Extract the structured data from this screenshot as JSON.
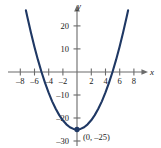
{
  "chart_data": {
    "type": "line",
    "title": "",
    "subtitle": "",
    "xlabel": "x",
    "ylabel": "y",
    "xlim": [
      -9,
      9
    ],
    "ylim": [
      -32,
      26
    ],
    "grid": false,
    "legend": null,
    "equation": "y = x^2 - 25",
    "x_ticks": [
      -8,
      -6,
      -4,
      -2,
      2,
      4,
      6,
      8
    ],
    "x_tick_labels": [
      "–8",
      "–6",
      "–4",
      "–2",
      "2",
      "4",
      "6",
      "8"
    ],
    "y_ticks": [
      20,
      10,
      -10,
      -20,
      -30
    ],
    "y_tick_labels": [
      "20",
      "10",
      "–10",
      "–20",
      "–30"
    ],
    "series": [
      {
        "name": "parabola",
        "color": "#1f3864",
        "x": [
          -7.2,
          -7.0,
          -6.5,
          -6.0,
          -5.5,
          -5.0,
          -4.5,
          -4.0,
          -3.5,
          -3.0,
          -2.5,
          -2.0,
          -1.5,
          -1.0,
          -0.5,
          0.0,
          0.5,
          1.0,
          1.5,
          2.0,
          2.5,
          3.0,
          3.5,
          4.0,
          4.5,
          5.0,
          5.5,
          6.0,
          6.5,
          7.0,
          7.2
        ],
        "y": [
          26.84,
          24.0,
          17.25,
          11.0,
          5.25,
          0.0,
          -4.75,
          -9.0,
          -12.75,
          -16.0,
          -18.75,
          -21.0,
          -22.75,
          -24.0,
          -24.75,
          -25.0,
          -24.75,
          -24.0,
          -22.75,
          -21.0,
          -18.75,
          -16.0,
          -12.75,
          -9.0,
          -4.75,
          0.0,
          5.25,
          11.0,
          17.25,
          24.0,
          26.84
        ]
      }
    ],
    "annotations": [
      {
        "name": "vertex-point",
        "label": "(0, –25)",
        "x": 0,
        "y": -25,
        "marker": "filled-circle",
        "color": "#1f3864"
      }
    ],
    "x_intercepts": [
      -5,
      5
    ],
    "y_intercept": -25,
    "axis_color": "#6b6b6b",
    "background_color": "#ffffff"
  }
}
